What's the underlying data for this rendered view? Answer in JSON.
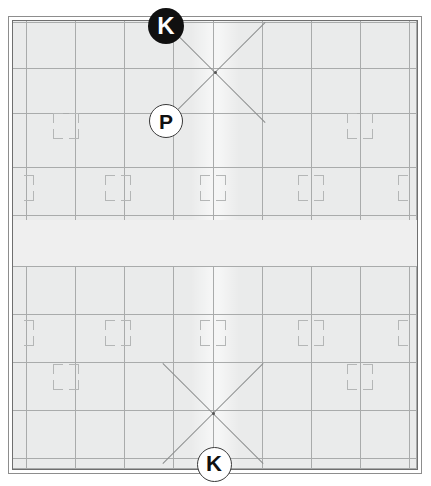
{
  "drawing": {
    "title": "Ceiling / floor tile reflected plan",
    "background_color": "#eaebeb",
    "grid_line_color": "#a9abab",
    "bracket_color": "#b4b6b6",
    "diagonal_color": "#8a8c8c",
    "frame": {
      "outer_border_color": "#8d8d8d",
      "inner_border_color": "#6f6f6f"
    }
  },
  "markers": [
    {
      "id": "marker-k-top",
      "label": "K",
      "style": "dark",
      "fill": "#101010",
      "text_color": "#ffffff",
      "x": 166,
      "y": 26,
      "size": 36
    },
    {
      "id": "marker-p",
      "label": "P",
      "style": "light",
      "fill": "#ffffff",
      "text_color": "#101010",
      "x": 165,
      "y": 120,
      "size": 32
    },
    {
      "id": "marker-k-bottom",
      "label": "K",
      "style": "light",
      "fill": "#ffffff",
      "text_color": "#101010",
      "x": 213,
      "y": 463,
      "size": 33
    }
  ],
  "grid": {
    "vertical_lines": [
      13,
      62,
      111,
      160,
      200,
      249,
      298,
      347,
      396,
      403
    ],
    "horizontal_lines": [
      1,
      47,
      92,
      146,
      194,
      245,
      293,
      341,
      389,
      437,
      447
    ],
    "band": {
      "top": 199,
      "height": 46,
      "color": "#efefef"
    }
  },
  "crosses": [
    {
      "id": "cross-top",
      "center_x": 202,
      "center_y": 51,
      "arm": 50
    },
    {
      "id": "cross-bottom",
      "center_x": 200,
      "center_y": 392,
      "arm": 50
    }
  ],
  "bracket_clusters": {
    "full": [
      [
        53,
        105
      ],
      [
        347,
        105
      ],
      [
        105,
        167
      ],
      [
        200,
        167
      ],
      [
        298,
        167
      ],
      [
        105,
        312
      ],
      [
        200,
        312
      ],
      [
        298,
        312
      ],
      [
        53,
        356
      ],
      [
        347,
        356
      ]
    ],
    "edge_left": [
      [
        8,
        167
      ],
      [
        8,
        312
      ]
    ],
    "edge_right": [
      [
        398,
        167
      ],
      [
        398,
        312
      ]
    ]
  }
}
